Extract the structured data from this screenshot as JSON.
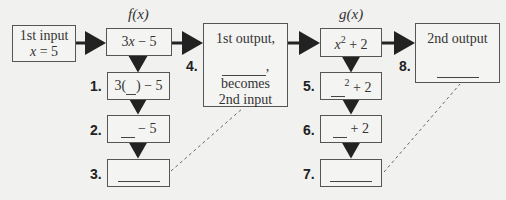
{
  "input_box": {
    "line1": "1st input",
    "var": "x",
    "eq": " = 5"
  },
  "f": {
    "name": "f(x)",
    "expr_pre": "3",
    "expr_var": "x",
    "expr_post": " − 5",
    "steps": [
      {
        "num": "1.",
        "pre": "3(",
        "blank": "__",
        "post": ") − 5"
      },
      {
        "num": "2.",
        "pre": "",
        "blank": "__",
        "post": " − 5"
      },
      {
        "num": "3.",
        "pre": "",
        "blank": "______",
        "post": ""
      }
    ]
  },
  "middle": {
    "num": "4.",
    "line1": "1st output,",
    "blank": "______",
    "comma": ",",
    "line3": "becomes",
    "line4": "2nd input"
  },
  "g": {
    "name": "g(x)",
    "expr_var": "x",
    "expr_sup": "2",
    "expr_post": " + 2",
    "steps": [
      {
        "num": "5.",
        "blank": "__",
        "sup": "2",
        "post": " + 2"
      },
      {
        "num": "6.",
        "blank": "__",
        "post": " + 2"
      },
      {
        "num": "7.",
        "blank": "______",
        "post": ""
      }
    ]
  },
  "output": {
    "num": "8.",
    "line1": "2nd output",
    "blank": "______"
  }
}
